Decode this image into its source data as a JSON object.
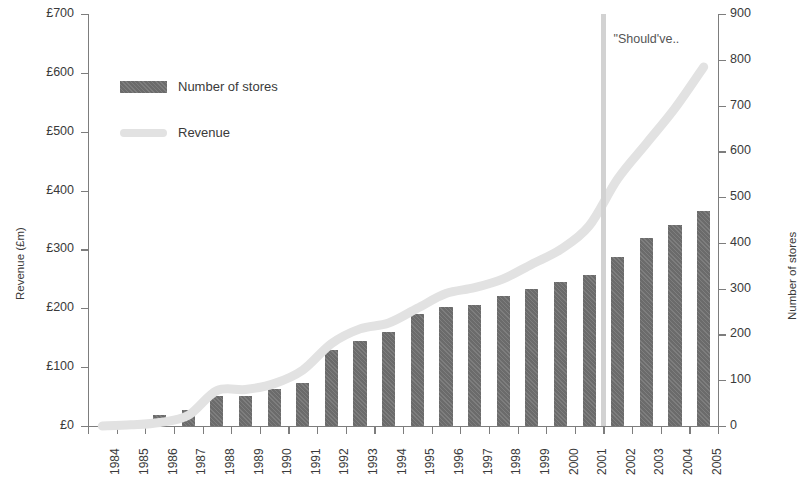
{
  "chart_data": {
    "type": "bar",
    "title": "",
    "xlabel": "",
    "ylabel": "Revenue (£m)",
    "y2label": "Number of stores",
    "grid": false,
    "legend_position": "top-left",
    "categories": [
      "1984",
      "1985",
      "1986",
      "1987",
      "1988",
      "1989",
      "1990",
      "1991",
      "1992",
      "1993",
      "1994",
      "1995",
      "1996",
      "1997",
      "1998",
      "1999",
      "2000",
      "2001",
      "2002",
      "2003",
      "2004",
      "2005"
    ],
    "ylim": [
      0,
      700
    ],
    "y2lim": [
      0,
      900
    ],
    "yticks": [
      "£0",
      "£100",
      "£200",
      "£300",
      "£400",
      "£500",
      "£600",
      "£700"
    ],
    "ytick_values": [
      0,
      100,
      200,
      300,
      400,
      500,
      600,
      700
    ],
    "y2ticks": [
      "0",
      "100",
      "200",
      "300",
      "400",
      "500",
      "600",
      "700",
      "800",
      "900"
    ],
    "y2tick_values": [
      0,
      100,
      200,
      300,
      400,
      500,
      600,
      700,
      800,
      900
    ],
    "series": [
      {
        "name": "Number of stores",
        "type": "bar",
        "axis": "right",
        "color": "#6b6b6b",
        "values": [
          0,
          10,
          25,
          35,
          65,
          65,
          80,
          95,
          165,
          185,
          205,
          245,
          260,
          265,
          285,
          300,
          315,
          330,
          370,
          410,
          440,
          470
        ]
      },
      {
        "name": "Revenue",
        "type": "line",
        "axis": "left",
        "color": "#e2e2e2",
        "values": [
          0,
          2,
          6,
          18,
          60,
          62,
          72,
          95,
          140,
          165,
          175,
          200,
          225,
          235,
          250,
          275,
          300,
          340,
          420,
          480,
          540,
          610
        ]
      }
    ],
    "annotations": [
      {
        "text": "\"Should've..",
        "x_category": "2001",
        "kind": "vertical-line-label",
        "line_color": "#d2d2d2"
      }
    ]
  },
  "legend": {
    "items": [
      {
        "label": "Number of stores",
        "swatch": "bar-swatch"
      },
      {
        "label": "Revenue",
        "swatch": "line-swatch"
      }
    ]
  }
}
